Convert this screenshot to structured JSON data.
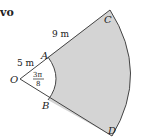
{
  "header_fragment": "vo",
  "diagram": {
    "points": {
      "O": "O",
      "A": "A",
      "B": "B",
      "C": "C",
      "D": "D"
    },
    "lengths": {
      "OA": "5 m",
      "AC": "9 m"
    },
    "angle": {
      "numerator": "3π",
      "denominator": "8"
    },
    "colors": {
      "shaded_region": "#d4d4d4",
      "stroke": "#444444",
      "background": "#ffffff"
    }
  }
}
